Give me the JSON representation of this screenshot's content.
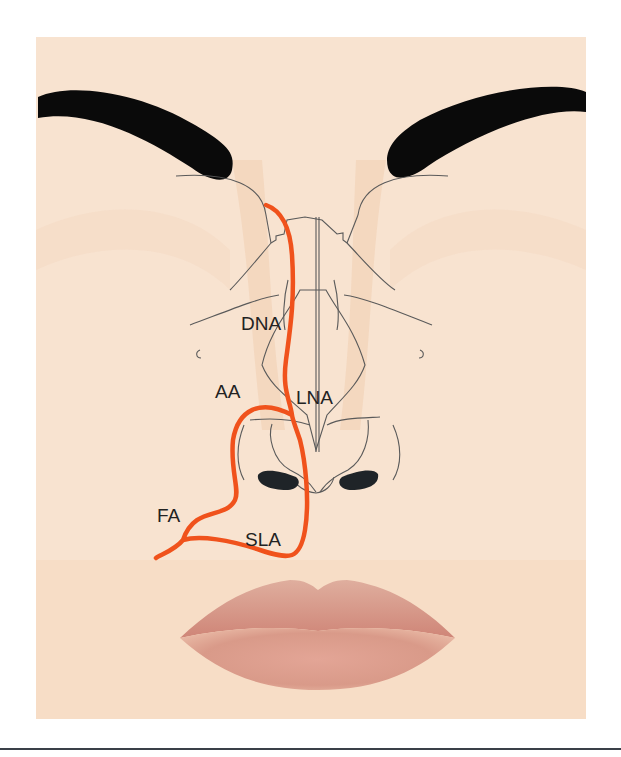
{
  "figure": {
    "colors": {
      "skin": "#f7e2cf",
      "skin_shadow": "#f1d3b8",
      "eyebrow": "#0a0a0a",
      "outline": "#555555",
      "artery": "#f0521c",
      "lip": "#d89a8a",
      "rule": "#3a4048"
    },
    "labels": {
      "dna": "DNA",
      "aa": "AA",
      "lna": "LNA",
      "fa": "FA",
      "sla": "SLA"
    }
  }
}
